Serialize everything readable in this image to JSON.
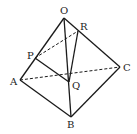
{
  "diagram": {
    "type": "tetrahedron",
    "points": {
      "O": {
        "x": 64,
        "y": 18,
        "label": "O",
        "lx": 60,
        "ly": 14
      },
      "A": {
        "x": 20,
        "y": 80,
        "label": "A",
        "lx": 10,
        "ly": 85
      },
      "B": {
        "x": 71,
        "y": 117,
        "label": "B",
        "lx": 67,
        "ly": 128
      },
      "C": {
        "x": 120,
        "y": 67,
        "label": "C",
        "lx": 123,
        "ly": 71
      },
      "P": {
        "x": 35,
        "y": 58,
        "label": "P",
        "lx": 27,
        "ly": 59
      },
      "Q": {
        "x": 69,
        "y": 82,
        "label": "Q",
        "lx": 72,
        "ly": 89
      },
      "R": {
        "x": 78,
        "y": 31,
        "label": "R",
        "lx": 80,
        "ly": 30
      }
    },
    "solid_edges": [
      [
        "O",
        "A"
      ],
      [
        "O",
        "C"
      ],
      [
        "A",
        "B"
      ],
      [
        "B",
        "C"
      ],
      [
        "O",
        "B"
      ],
      [
        "P",
        "Q"
      ],
      [
        "R",
        "Q"
      ]
    ],
    "dashed_edges": [
      [
        "A",
        "C"
      ],
      [
        "P",
        "R"
      ]
    ],
    "labels": {
      "O": "O",
      "A": "A",
      "B": "B",
      "C": "C",
      "P": "P",
      "Q": "Q",
      "R": "R"
    }
  }
}
